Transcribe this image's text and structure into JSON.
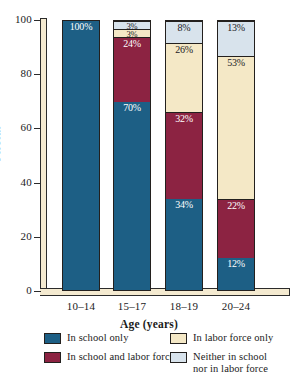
{
  "chart_data": {
    "type": "bar",
    "subtype": "100% stacked column",
    "title": "",
    "xlabel": "Age (years)",
    "ylabel": "Percent",
    "ylim": [
      0,
      100
    ],
    "yticks": [
      0,
      20,
      40,
      60,
      80,
      100
    ],
    "ytick_labels": [
      "0",
      "20",
      "40",
      "60",
      "80",
      "100"
    ],
    "grid": false,
    "legend_position": "bottom",
    "categories": [
      "10–14",
      "15–17",
      "18–19",
      "20–24"
    ],
    "series": [
      {
        "name": "In school only",
        "color": "#1d5f85",
        "values": [
          100,
          70,
          34,
          12
        ],
        "labels": [
          "100%",
          "70%",
          "34%",
          "12%"
        ],
        "label_color": "light"
      },
      {
        "name": "In school and labor force",
        "color": "#8c2342",
        "values": [
          0,
          24,
          32,
          22
        ],
        "labels": [
          "",
          "24%",
          "32%",
          "22%"
        ],
        "label_color": "light"
      },
      {
        "name": "In labor force only",
        "color": "#f4e8c6",
        "values": [
          0,
          3,
          26,
          53
        ],
        "labels": [
          "",
          "3%",
          "26%",
          "53%"
        ],
        "label_color": "dark"
      },
      {
        "name": "Neither in school nor in labor force",
        "color": "#d8e3ec",
        "values": [
          0,
          3,
          8,
          13
        ],
        "labels": [
          "",
          "3%",
          "8%",
          "13%"
        ],
        "label_color": "dark"
      }
    ]
  },
  "legend": {
    "items": [
      {
        "label": "In school only",
        "color": "#1d5f85"
      },
      {
        "label": "In school and labor force",
        "color": "#8c2342"
      },
      {
        "label": "In labor force only",
        "color": "#f4e8c6"
      },
      {
        "label": "Neither in school\nnor in labor force",
        "color": "#d8e3ec"
      }
    ]
  },
  "axes": {
    "y_label": "Percent",
    "x_label": "Age (years)",
    "y_tick_labels": [
      "100",
      "80",
      "60",
      "40",
      "20",
      "0"
    ],
    "x_tick_labels": [
      "10–14",
      "15–17",
      "18–19",
      "20–24"
    ]
  },
  "colors": {
    "axis_band": "#f4ead0",
    "outline": "#23201e",
    "background": "#ffffff"
  }
}
